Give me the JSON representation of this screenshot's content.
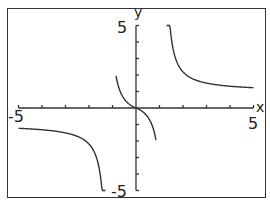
{
  "chart_data": {
    "type": "line",
    "title": "",
    "xlabel": "x",
    "ylabel": "y",
    "xlim": [
      -5,
      5
    ],
    "ylim": [
      -5,
      5
    ],
    "grid": false,
    "x_tick_step": 1,
    "y_tick_step": 1,
    "tick_labels": {
      "x_min": "-5",
      "x_max": "5",
      "y_min": "-5",
      "y_max": "5"
    },
    "vertical_asymptotes": [
      -1.2,
      1.2
    ],
    "horizontal_asymptotes": [
      -1,
      1
    ],
    "series": [
      {
        "name": "left-branch",
        "x": [
          -5,
          -4,
          -3,
          -2.5,
          -2,
          -1.6,
          -1.4,
          -1.3
        ],
        "y": [
          -1.1,
          -1.15,
          -1.3,
          -1.5,
          -2.0,
          -3.0,
          -4.3,
          -5.0
        ]
      },
      {
        "name": "middle-branch",
        "x": [
          -0.85,
          -0.7,
          -0.5,
          -0.3,
          0,
          0.3,
          0.5,
          0.7,
          0.85
        ],
        "y": [
          5.0,
          3.4,
          1.5,
          0.5,
          0,
          -0.5,
          -1.5,
          -3.4,
          -5.0
        ]
      },
      {
        "name": "right-branch",
        "x": [
          1.3,
          1.4,
          1.6,
          2,
          2.5,
          3,
          4,
          5
        ],
        "y": [
          5.0,
          4.3,
          3.0,
          2.0,
          1.5,
          1.3,
          1.15,
          1.1
        ]
      }
    ],
    "line_color": "#333333"
  },
  "labels": {
    "x_axis": "x",
    "y_axis": "y",
    "x_min": "-5",
    "x_max": "5",
    "y_min": "-5",
    "y_max": "5"
  }
}
